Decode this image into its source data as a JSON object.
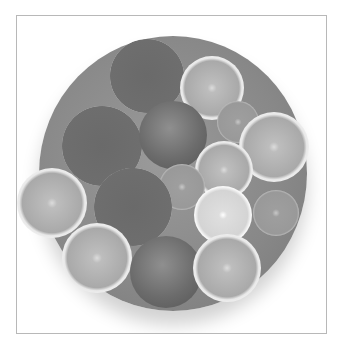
{
  "image": {
    "description": "Grayscale photograph of a round plate holding halved grapefruits, oranges, lemons, limes and whole apples, shown within a thin light-gray bordered frame",
    "frame_border_color": "#b8b8b8",
    "background_color": "#ffffff",
    "items": [
      {
        "type": "grapefruit",
        "x": 93,
        "y": 23,
        "d": 74
      },
      {
        "type": "orange",
        "x": 163,
        "y": 40,
        "d": 64
      },
      {
        "type": "grapefruit",
        "x": 45,
        "y": 90,
        "d": 80
      },
      {
        "type": "apple",
        "x": 122,
        "y": 85,
        "d": 68
      },
      {
        "type": "lime",
        "x": 200,
        "y": 85,
        "d": 42
      },
      {
        "type": "orange",
        "x": 222,
        "y": 96,
        "d": 70
      },
      {
        "type": "orange",
        "x": 178,
        "y": 125,
        "d": 58
      },
      {
        "type": "lime",
        "x": 142,
        "y": 148,
        "d": 46
      },
      {
        "type": "orange",
        "x": 0,
        "y": 152,
        "d": 70
      },
      {
        "type": "grapefruit",
        "x": 77,
        "y": 152,
        "d": 78
      },
      {
        "type": "lemon",
        "x": 177,
        "y": 170,
        "d": 58
      },
      {
        "type": "lime",
        "x": 236,
        "y": 174,
        "d": 46
      },
      {
        "type": "orange",
        "x": 45,
        "y": 207,
        "d": 70
      },
      {
        "type": "apple",
        "x": 113,
        "y": 220,
        "d": 72
      },
      {
        "type": "orange",
        "x": 176,
        "y": 218,
        "d": 68
      }
    ]
  }
}
